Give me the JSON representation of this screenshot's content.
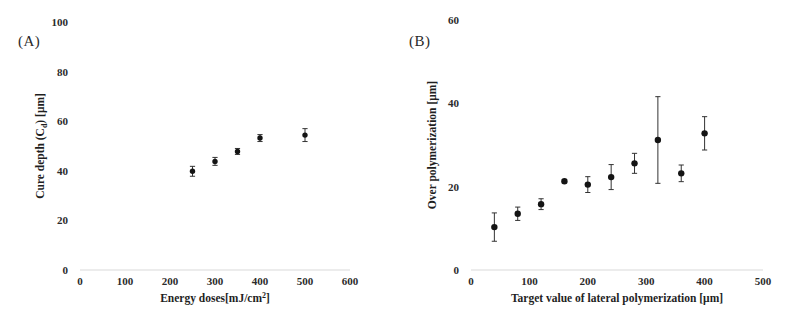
{
  "figure": {
    "background": "#ffffff",
    "marker_color": "#141414",
    "errorbar_color": "#333333"
  },
  "panels": [
    {
      "tag": "(A)",
      "tag_name": "panel-label-a"
    },
    {
      "tag": "(B)",
      "tag_name": "panel-label-b"
    }
  ],
  "chart_data": [
    {
      "type": "scatter",
      "panel": "(A)",
      "title": "",
      "xlabel": "Energy doses[mJ/cm²]",
      "xlabel_main": "Energy doses[mJ/cm",
      "xlabel_exp": "2",
      "xlabel_tail": "]",
      "ylabel": "Cure depth (Cₔ) [μm]",
      "ylabel_main": "Cure depth (C",
      "ylabel_sub": "d",
      "ylabel_tail": ") [μm]",
      "xlim": [
        0,
        600
      ],
      "ylim": [
        0,
        100
      ],
      "xticks": [
        0,
        100,
        200,
        300,
        400,
        500,
        600
      ],
      "xtick_labels": [
        "0",
        "100",
        "200",
        "300",
        "400",
        "500",
        "600"
      ],
      "yticks": [
        0,
        20,
        40,
        60,
        80,
        100
      ],
      "ytick_labels": [
        "0",
        "20",
        "40",
        "60",
        "80",
        "100"
      ],
      "grid": false,
      "x": [
        250,
        300,
        350,
        400,
        500
      ],
      "y": [
        39.8,
        43.8,
        47.8,
        53.2,
        54.4
      ],
      "yerr": [
        2.0,
        1.6,
        1.2,
        1.4,
        2.6
      ],
      "legend": null
    },
    {
      "type": "scatter",
      "panel": "(B)",
      "title": "",
      "xlabel": "Target value of lateral polymerization [μm]",
      "ylabel": "Over polymerization [μm]",
      "xlim": [
        0,
        500
      ],
      "ylim": [
        0,
        60
      ],
      "xticks": [
        0,
        100,
        200,
        300,
        400,
        500
      ],
      "xtick_labels": [
        "0",
        "100",
        "200",
        "300",
        "400",
        "500"
      ],
      "yticks": [
        0,
        20,
        40,
        60
      ],
      "ytick_labels": [
        "0",
        "20",
        "40",
        "60"
      ],
      "grid": false,
      "x": [
        40,
        80,
        120,
        160,
        200,
        240,
        280,
        320,
        360,
        400
      ],
      "y": [
        10.3,
        13.5,
        15.8,
        21.3,
        20.5,
        22.3,
        25.6,
        31.2,
        23.2,
        32.8
      ],
      "yerr": [
        3.4,
        1.6,
        1.3,
        0.4,
        1.9,
        3.0,
        2.4,
        10.4,
        2.0,
        4.0
      ],
      "legend": null
    }
  ]
}
